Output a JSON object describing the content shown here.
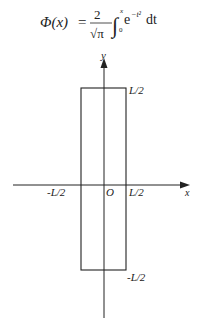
{
  "formula": {
    "lhs": "Φ(x)",
    "equals": "=",
    "numerator": "2",
    "sqrt": "√π",
    "integral": "∫",
    "upper": "x",
    "lower": "0",
    "integrand": "e",
    "exponent": "−t²",
    "differential": "dt"
  },
  "diagram": {
    "x_axis_label": "x",
    "y_axis_label": "y",
    "origin_label": "O",
    "top_label": "L/2",
    "bottom_label": "-L/2",
    "left_label": "-L/2",
    "right_label": "L/2",
    "stroke_color": "#222222"
  }
}
